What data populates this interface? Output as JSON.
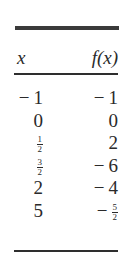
{
  "table": {
    "headers": {
      "x": "x",
      "fx": "f(x)"
    },
    "rows": [
      {
        "x": {
          "sign": "−",
          "value": "1"
        },
        "fx": {
          "sign": "−",
          "value": "1"
        }
      },
      {
        "x": {
          "sign": "",
          "value": "0"
        },
        "fx": {
          "sign": "",
          "value": "0"
        }
      },
      {
        "x": {
          "sign": "",
          "num": "1",
          "den": "2"
        },
        "fx": {
          "sign": "",
          "value": "2"
        }
      },
      {
        "x": {
          "sign": "",
          "num": "3",
          "den": "2"
        },
        "fx": {
          "sign": "−",
          "value": "6"
        }
      },
      {
        "x": {
          "sign": "",
          "value": "2"
        },
        "fx": {
          "sign": "−",
          "value": "4"
        }
      },
      {
        "x": {
          "sign": "",
          "value": "5"
        },
        "fx": {
          "sign": "−",
          "num": "5",
          "den": "2"
        }
      }
    ]
  }
}
